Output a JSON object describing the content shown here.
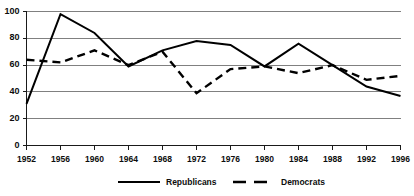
{
  "chart_data": {
    "type": "line",
    "title": "",
    "xlabel": "",
    "ylabel": "",
    "categories": [
      "1952",
      "1956",
      "1960",
      "1964",
      "1968",
      "1972",
      "1976",
      "1980",
      "1984",
      "1988",
      "1992",
      "1996"
    ],
    "x": [
      1952,
      1956,
      1960,
      1964,
      1968,
      1972,
      1976,
      1980,
      1984,
      1988,
      1992,
      1996
    ],
    "xlim": [
      1952,
      1996
    ],
    "ylim": [
      0,
      100
    ],
    "yticks": [
      0,
      20,
      40,
      60,
      80,
      100
    ],
    "ytick_labels": [
      "0",
      "20",
      "40",
      "60",
      "80",
      "100"
    ],
    "xtick_labels": [
      "1952",
      "1956",
      "1960",
      "1964",
      "1968",
      "1972",
      "1976",
      "1980",
      "1984",
      "1988",
      "1992",
      "1996"
    ],
    "grid": "horizontal",
    "legend_position": "bottom",
    "series": [
      {
        "name": "Republicans",
        "style": "solid",
        "color": "#000000",
        "values": [
          31,
          98,
          84,
          59,
          71,
          78,
          75,
          59,
          76,
          60,
          44,
          37
        ]
      },
      {
        "name": "Democrats",
        "style": "dashed",
        "color": "#000000",
        "values": [
          64,
          62,
          71,
          60,
          70,
          39,
          57,
          59,
          54,
          60,
          49,
          52
        ]
      }
    ]
  },
  "legend": {
    "items": [
      {
        "label": "Republicans",
        "style": "solid"
      },
      {
        "label": "Democrats",
        "style": "dashed"
      }
    ]
  },
  "colors": {
    "axis": "#1a1a1a",
    "grid": "#808080",
    "series": "#000000",
    "background": "#ffffff"
  }
}
